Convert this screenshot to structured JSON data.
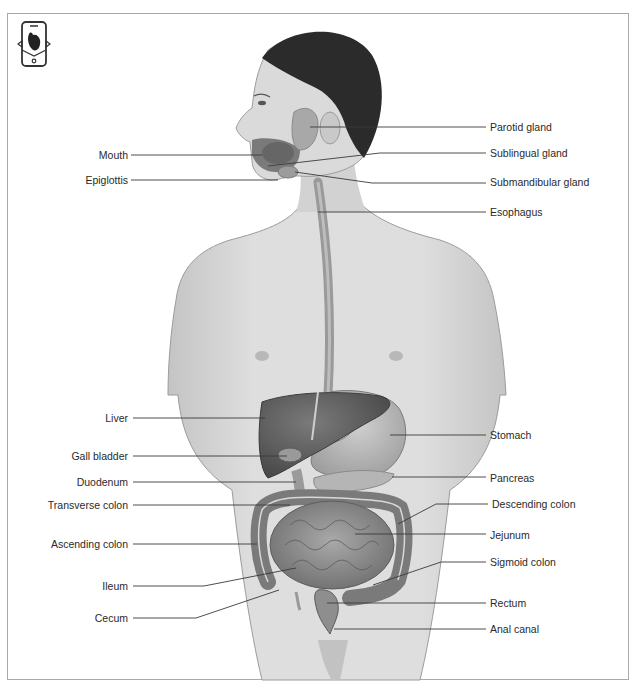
{
  "diagram": {
    "title_icon": "anatomy-app-icon",
    "labels_left": [
      {
        "id": "mouth",
        "text": "Mouth",
        "x": 60,
        "y": 149,
        "width": 68,
        "line": [
          [
            131,
            155
          ],
          [
            262,
            155
          ]
        ]
      },
      {
        "id": "epiglottis",
        "text": "Epiglottis",
        "x": 50,
        "y": 174,
        "width": 78,
        "line": [
          [
            131,
            180
          ],
          [
            278,
            180
          ]
        ]
      },
      {
        "id": "liver",
        "text": "Liver",
        "x": 60,
        "y": 412,
        "width": 68,
        "line": [
          [
            133,
            418
          ],
          [
            265,
            418
          ]
        ]
      },
      {
        "id": "gall-bladder",
        "text": "Gall bladder",
        "x": 40,
        "y": 450,
        "width": 88,
        "line": [
          [
            133,
            456
          ],
          [
            287,
            456
          ]
        ]
      },
      {
        "id": "duodenum",
        "text": "Duodenum",
        "x": 40,
        "y": 476,
        "width": 88,
        "line": [
          [
            133,
            482
          ],
          [
            296,
            482
          ]
        ]
      },
      {
        "id": "transverse-colon",
        "text": "Transverse colon",
        "x": 10,
        "y": 499,
        "width": 118,
        "line": [
          [
            133,
            505
          ],
          [
            290,
            505
          ]
        ]
      },
      {
        "id": "ascending-colon",
        "text": "Ascending colon",
        "x": 10,
        "y": 538,
        "width": 118,
        "line": [
          [
            133,
            544
          ],
          [
            257,
            544
          ]
        ]
      },
      {
        "id": "ileum",
        "text": "Ileum",
        "x": 60,
        "y": 580,
        "width": 68,
        "line": [
          [
            133,
            586
          ],
          [
            204,
            586
          ],
          [
            296,
            568
          ]
        ]
      },
      {
        "id": "cecum",
        "text": "Cecum",
        "x": 60,
        "y": 612,
        "width": 68,
        "line": [
          [
            133,
            618
          ],
          [
            196,
            618
          ],
          [
            279,
            590
          ]
        ]
      }
    ],
    "labels_right": [
      {
        "id": "parotid-gland",
        "text": "Parotid gland",
        "x": 490,
        "y": 121,
        "line": [
          [
            310,
            127
          ],
          [
            486,
            127
          ]
        ]
      },
      {
        "id": "sublingual-gland",
        "text": "Sublingual gland",
        "x": 490,
        "y": 147,
        "line": [
          [
            268,
            166
          ],
          [
            380,
            153
          ],
          [
            486,
            153
          ]
        ]
      },
      {
        "id": "submandibular-gland",
        "text": "Submandibular gland",
        "x": 490,
        "y": 176,
        "line": [
          [
            295,
            172
          ],
          [
            372,
            183
          ],
          [
            486,
            183
          ]
        ]
      },
      {
        "id": "esophagus",
        "text": "Esophagus",
        "x": 490,
        "y": 206,
        "line": [
          [
            318,
            212
          ],
          [
            486,
            212
          ]
        ]
      },
      {
        "id": "stomach",
        "text": "Stomach",
        "x": 490,
        "y": 429,
        "line": [
          [
            390,
            435
          ],
          [
            486,
            435
          ]
        ]
      },
      {
        "id": "pancreas",
        "text": "Pancreas",
        "x": 490,
        "y": 472,
        "line": [
          [
            392,
            477
          ],
          [
            486,
            477
          ]
        ]
      },
      {
        "id": "descending-colon",
        "text": "Descending colon",
        "x": 492,
        "y": 498,
        "line": [
          [
            398,
            524
          ],
          [
            436,
            504
          ],
          [
            488,
            504
          ]
        ]
      },
      {
        "id": "jejunum",
        "text": "Jejunum",
        "x": 490,
        "y": 529,
        "line": [
          [
            355,
            534
          ],
          [
            486,
            534
          ]
        ]
      },
      {
        "id": "sigmoid-colon",
        "text": "Sigmoid colon",
        "x": 490,
        "y": 556,
        "line": [
          [
            373,
            585
          ],
          [
            441,
            562
          ],
          [
            486,
            562
          ]
        ]
      },
      {
        "id": "rectum",
        "text": "Rectum",
        "x": 490,
        "y": 597,
        "line": [
          [
            327,
            603
          ],
          [
            486,
            603
          ]
        ]
      },
      {
        "id": "anal-canal",
        "text": "Anal canal",
        "x": 490,
        "y": 623,
        "line": [
          [
            334,
            629
          ],
          [
            486,
            629
          ]
        ]
      }
    ],
    "colors": {
      "frame": "#a9a9a9",
      "skin": "#d9d9d9",
      "skin_shadow": "#bdbdbd",
      "hair": "#2b2b2b",
      "organ_dark": "#5e5e5e",
      "organ_mid": "#8a8a8a",
      "organ_light": "#b3b3b3",
      "leader": "#3a3a3a",
      "text": "#2a2a2a"
    }
  }
}
